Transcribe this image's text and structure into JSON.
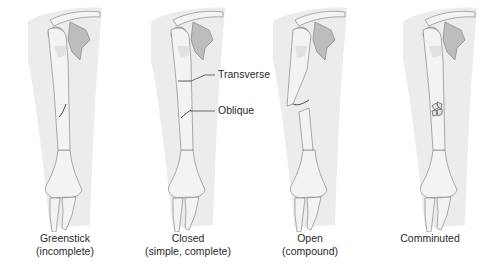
{
  "figure": {
    "type": "labeled anatomical illustration of humerus fractures",
    "colors": {
      "background": "#ffffff",
      "skin_shade": "#ececec",
      "bone_fill": "#f3f3f3",
      "bone_shadow": "#d6d6d6",
      "scapula_shadow": "#bdbdbd",
      "outline": "#777777",
      "fracture_line": "#333333",
      "text": "#2a2a2a"
    },
    "panels": [
      {
        "id": "greenstick",
        "title": "Greenstick",
        "subtitle": "(incomplete)"
      },
      {
        "id": "closed",
        "title": "Closed",
        "subtitle": "(simple, complete)"
      },
      {
        "id": "open",
        "title": "Open",
        "subtitle": "(compound)"
      },
      {
        "id": "comminuted",
        "title": "Comminuted",
        "subtitle": ""
      }
    ],
    "callouts": [
      {
        "label": "Transverse"
      },
      {
        "label": "Oblique"
      }
    ]
  }
}
